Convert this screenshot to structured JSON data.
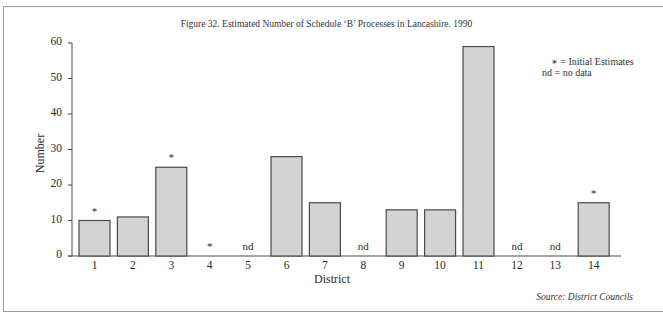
{
  "chart_data": {
    "type": "bar",
    "title": "Figure 32.  Estimated Number of Schedule ‘B’ Processes in Lancashire. 1990",
    "xlabel": "District",
    "ylabel": "Number",
    "ylim": [
      0,
      60
    ],
    "yticks": [
      0,
      10,
      20,
      30,
      40,
      50,
      60
    ],
    "grid": false,
    "categories": [
      "1",
      "2",
      "3",
      "4",
      "5",
      "6",
      "7",
      "8",
      "9",
      "10",
      "11",
      "12",
      "13",
      "14"
    ],
    "values": [
      10,
      11,
      25,
      0,
      null,
      28,
      15,
      null,
      13,
      13,
      59,
      null,
      null,
      15
    ],
    "annotations": [
      "*",
      "",
      "*",
      "*",
      "nd",
      "",
      "",
      "nd",
      "",
      "",
      "",
      "nd",
      "nd",
      "*"
    ],
    "legend": {
      "position": "top-right",
      "entries": [
        "* = Initial Estimates",
        "nd = no data"
      ]
    },
    "source": "Source: District Councils",
    "colors": {
      "bar_fill": "#d3d3d3",
      "bar_edge": "#4a4a4a",
      "axis": "#4a4a4a"
    }
  },
  "legend_line1": "∗ = Initial Estimates",
  "legend_line2": "nd = no data"
}
